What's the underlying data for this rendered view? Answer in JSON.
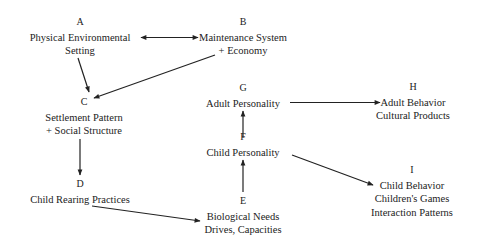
{
  "diagram": {
    "type": "flow-diagram",
    "nodes": {
      "A": {
        "letter": "A",
        "lines": [
          "Physical Environmental",
          "Setting"
        ]
      },
      "B": {
        "letter": "B",
        "lines": [
          "Maintenance System",
          "+ Economy"
        ]
      },
      "C": {
        "letter": "C",
        "lines": [
          "Settlement Pattern",
          "+ Social Structure"
        ]
      },
      "D": {
        "letter": "D",
        "lines": [
          "Child Rearing Practices"
        ]
      },
      "E": {
        "letter": "E",
        "lines": [
          "Biological Needs",
          "Drives, Capacities"
        ]
      },
      "F": {
        "letter": "F",
        "lines": [
          "Child Personality"
        ]
      },
      "G": {
        "letter": "G",
        "lines": [
          "Adult Personality"
        ]
      },
      "H": {
        "letter": "H",
        "lines": [
          "Adult Behavior",
          "Cultural Products"
        ]
      },
      "I": {
        "letter": "I",
        "lines": [
          "Child Behavior",
          "Children's Games",
          "Interaction Patterns"
        ]
      }
    },
    "edges": [
      {
        "from": "A",
        "to": "B",
        "bidirectional": true
      },
      {
        "from": "A",
        "to": "C"
      },
      {
        "from": "B",
        "to": "C"
      },
      {
        "from": "C",
        "to": "D"
      },
      {
        "from": "D",
        "to": "E"
      },
      {
        "from": "E",
        "to": "F"
      },
      {
        "from": "F",
        "to": "G"
      },
      {
        "from": "G",
        "to": "H"
      },
      {
        "from": "F",
        "to": "I"
      }
    ],
    "colors": {
      "ink": "#222222",
      "background": "#ffffff"
    }
  }
}
